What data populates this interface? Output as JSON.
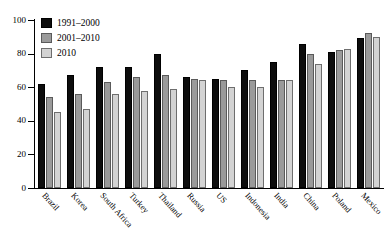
{
  "chart_data": {
    "type": "bar",
    "title": "",
    "subtitle": "",
    "xlabel": "",
    "ylabel": "",
    "ylim": [
      0,
      100
    ],
    "yticks": [
      0,
      20,
      40,
      60,
      80,
      100
    ],
    "ytick_labels": [
      "0",
      "20",
      "40",
      "60",
      "80",
      "100"
    ],
    "grid": false,
    "legend_position": "top-left",
    "categories": [
      "Brazil",
      "Korea",
      "South Africa",
      "Turkey",
      "Thailand",
      "Russia",
      "US",
      "Indonesia",
      "India",
      "China",
      "Poland",
      "Mexico"
    ],
    "series": [
      {
        "name": "1991–2000",
        "color": "#0d0d0d",
        "values": [
          62,
          67,
          72,
          72,
          80,
          66,
          65,
          70,
          75,
          86,
          81,
          89
        ]
      },
      {
        "name": "2001–2010",
        "color": "#9a9a9a",
        "values": [
          54,
          56,
          63,
          66,
          67,
          65,
          64,
          64,
          64,
          80,
          82,
          92
        ]
      },
      {
        "name": "2010",
        "color": "#d3d3d3",
        "values": [
          45,
          47,
          56,
          58,
          59,
          64,
          60,
          60,
          64,
          74,
          83,
          90
        ]
      }
    ]
  },
  "legend": {
    "items": [
      {
        "label": "1991–2000",
        "swatch": "legend-swatch-black"
      },
      {
        "label": "2001–2010",
        "swatch": "legend-swatch-gray"
      },
      {
        "label": "2010",
        "swatch": "legend-swatch-light-gray"
      }
    ]
  },
  "axes": {
    "y_tick_labels": [
      "100",
      "80",
      "60",
      "40",
      "20",
      "0"
    ]
  }
}
